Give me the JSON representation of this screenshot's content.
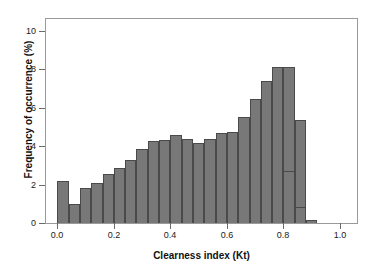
{
  "chart_data": {
    "type": "bar",
    "title": "",
    "xlabel": "Clearness index (Kt)",
    "ylabel": "Frequency of occurrence (%)",
    "xlim": [
      -0.04,
      1.06
    ],
    "ylim": [
      0,
      10.6
    ],
    "grid": false,
    "legend": null,
    "bin_width": 0.04,
    "bar_color": "#787878",
    "bar_edge_color": "#4a4a4a",
    "xticks": [
      "0.0",
      "0.2",
      "0.4",
      "0.6",
      "0.8",
      "1.0"
    ],
    "xtick_values": [
      0.0,
      0.2,
      0.4,
      0.6,
      0.8,
      1.0
    ],
    "yticks": [
      "0",
      "2",
      "4",
      "6",
      "8",
      "10"
    ],
    "ytick_values": [
      0,
      2,
      4,
      6,
      8,
      10
    ],
    "categories": [
      "0.00",
      "0.04",
      "0.08",
      "0.12",
      "0.16",
      "0.20",
      "0.24",
      "0.28",
      "0.32",
      "0.36",
      "0.40",
      "0.44",
      "0.48",
      "0.52",
      "0.56",
      "0.60",
      "0.64",
      "0.68",
      "0.72",
      "0.76",
      "0.80",
      "0.84"
    ],
    "bin_left_edges": [
      0.0,
      0.04,
      0.08,
      0.12,
      0.16,
      0.2,
      0.24,
      0.28,
      0.32,
      0.36,
      0.4,
      0.44,
      0.48,
      0.52,
      0.56,
      0.6,
      0.64,
      0.68,
      0.72,
      0.76,
      0.8,
      0.84
    ],
    "values": [
      2.2,
      1.0,
      1.8,
      2.1,
      2.55,
      2.85,
      3.25,
      3.85,
      4.25,
      4.3,
      4.55,
      4.35,
      4.15,
      4.35,
      4.7,
      4.75,
      5.5,
      6.45,
      7.4,
      8.1,
      8.1,
      5.35
    ],
    "tail_values": [
      2.7,
      0.85,
      0.15
    ],
    "tail_left_edges": [
      0.8,
      0.84,
      0.88
    ]
  }
}
